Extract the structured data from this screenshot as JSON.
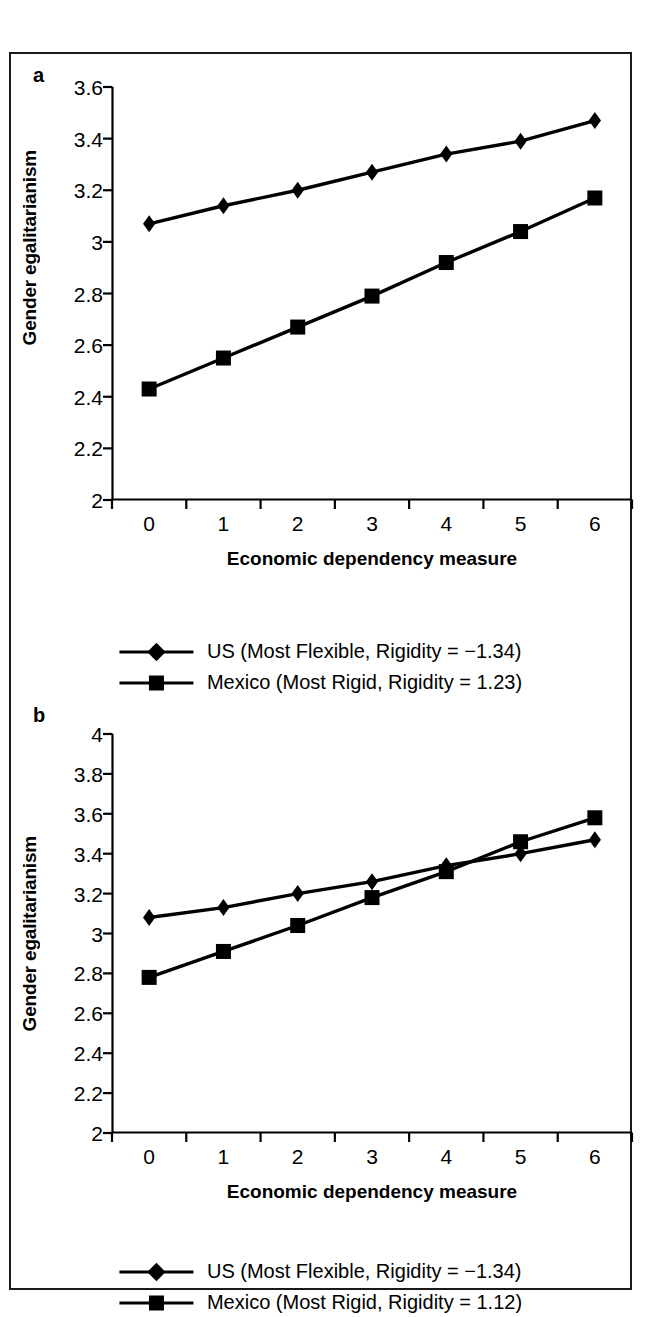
{
  "figure": {
    "panels": [
      {
        "letter": "a",
        "ylabel": "Gender egalitarianism",
        "xlabel": "Economic dependency measure",
        "legend": [
          "US (Most Flexible, Rigidity = −1.34)",
          "Mexico (Most Rigid, Rigidity = 1.23)"
        ]
      },
      {
        "letter": "b",
        "ylabel": "Gender egalitarianism",
        "xlabel": "Economic dependency measure",
        "legend": [
          "US (Most Flexible, Rigidity = −1.34)",
          "Mexico (Most Rigid, Rigidity = 1.12)"
        ]
      }
    ]
  },
  "chart_data": [
    {
      "type": "line",
      "panel": "a",
      "title": "",
      "xlabel": "Economic dependency measure",
      "ylabel": "Gender egalitarianism",
      "x": [
        0,
        1,
        2,
        3,
        4,
        5,
        6
      ],
      "xticklabels": [
        "0",
        "1",
        "2",
        "3",
        "4",
        "5",
        "6"
      ],
      "yticklabels": [
        "2",
        "2.2",
        "2.4",
        "2.6",
        "2.8",
        "3",
        "3.2",
        "3.4",
        "3.6"
      ],
      "yticks": [
        2,
        2.2,
        2.4,
        2.6,
        2.8,
        3,
        3.2,
        3.4,
        3.6
      ],
      "ylim": [
        2,
        3.6
      ],
      "xlim": [
        -0.5,
        6.5
      ],
      "grid": false,
      "legend_position": "below",
      "series": [
        {
          "name": "US (Most Flexible, Rigidity = −1.34)",
          "marker": "diamond",
          "color": "#000000",
          "values": [
            3.07,
            3.14,
            3.2,
            3.27,
            3.34,
            3.39,
            3.47
          ]
        },
        {
          "name": "Mexico (Most Rigid, Rigidity = 1.23)",
          "marker": "square",
          "color": "#000000",
          "values": [
            2.43,
            2.55,
            2.67,
            2.79,
            2.92,
            3.04,
            3.17
          ]
        }
      ]
    },
    {
      "type": "line",
      "panel": "b",
      "title": "",
      "xlabel": "Economic dependency measure",
      "ylabel": "Gender egalitarianism",
      "x": [
        0,
        1,
        2,
        3,
        4,
        5,
        6
      ],
      "xticklabels": [
        "0",
        "1",
        "2",
        "3",
        "4",
        "5",
        "6"
      ],
      "yticklabels": [
        "2",
        "2.2",
        "2.4",
        "2.6",
        "2.8",
        "3",
        "3.2",
        "3.4",
        "3.6",
        "3.8",
        "4"
      ],
      "yticks": [
        2,
        2.2,
        2.4,
        2.6,
        2.8,
        3,
        3.2,
        3.4,
        3.6,
        3.8,
        4
      ],
      "ylim": [
        2,
        4
      ],
      "xlim": [
        -0.5,
        6.5
      ],
      "grid": false,
      "legend_position": "below",
      "series": [
        {
          "name": "US (Most Flexible, Rigidity = −1.34)",
          "marker": "diamond",
          "color": "#000000",
          "values": [
            3.08,
            3.13,
            3.2,
            3.26,
            3.34,
            3.4,
            3.47
          ]
        },
        {
          "name": "Mexico (Most Rigid, Rigidity = 1.12)",
          "marker": "square",
          "color": "#000000",
          "values": [
            2.78,
            2.91,
            3.04,
            3.18,
            3.31,
            3.46,
            3.58
          ]
        }
      ]
    }
  ]
}
